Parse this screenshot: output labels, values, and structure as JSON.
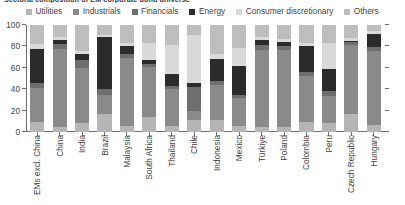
{
  "chart_data": {
    "type": "bar",
    "stacked": true,
    "title": "Sectoral composition of EM corporate bond universe",
    "xlabel": "",
    "ylabel": "",
    "ylim": [
      0,
      100
    ],
    "yticks": [
      0,
      20,
      40,
      60,
      80,
      100
    ],
    "grid": false,
    "legend_position": "top",
    "unit": "%",
    "categories": [
      "EMs excl. China",
      "China",
      "India",
      "Brazil",
      "Malaysia",
      "South Africa",
      "Thailand",
      "Chile",
      "Indonesia",
      "Mexico",
      "Türkiye",
      "Poland",
      "Colombia",
      "Peru",
      "Czech Republic",
      "Hungary"
    ],
    "series": [
      {
        "name": "Utilities",
        "color": "#b5b5b5",
        "values": [
          9,
          5,
          8,
          17,
          6,
          14,
          6,
          11,
          11,
          6,
          5,
          5,
          9,
          8,
          17,
          7
        ]
      },
      {
        "name": "Industrials",
        "color": "#8a8a8a",
        "values": [
          32,
          73,
          52,
          18,
          63,
          47,
          34,
          9,
          33,
          26,
          72,
          72,
          43,
          26,
          64,
          69
        ]
      },
      {
        "name": "Financials",
        "color": "#6e6e6e",
        "values": [
          5,
          4,
          7,
          5,
          4,
          3,
          3,
          22,
          4,
          3,
          4,
          3,
          4,
          4,
          3,
          3
        ]
      },
      {
        "name": "Energy",
        "color": "#2b2b2b",
        "values": [
          32,
          4,
          6,
          49,
          7,
          3,
          11,
          4,
          20,
          27,
          5,
          4,
          24,
          21,
          1,
          13
        ]
      },
      {
        "name": "Consumer discretionary",
        "color": "#d9d9d9",
        "values": [
          4,
          3,
          3,
          2,
          3,
          16,
          27,
          45,
          5,
          17,
          3,
          3,
          3,
          24,
          3,
          2
        ]
      },
      {
        "name": "Others",
        "color": "#bdbdbd",
        "values": [
          18,
          11,
          24,
          9,
          17,
          17,
          19,
          9,
          27,
          21,
          11,
          13,
          17,
          17,
          12,
          6
        ]
      }
    ]
  }
}
